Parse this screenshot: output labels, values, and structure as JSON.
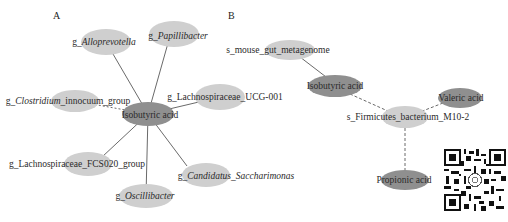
{
  "panels": {
    "A": {
      "label": "A",
      "center": {
        "name": "Isobutyric acid",
        "x": 148,
        "y": 114,
        "rx": 26,
        "ry": 12,
        "color": "#8f8f8f"
      },
      "nodes": [
        {
          "id": "alloprevotella",
          "prefix": "g_",
          "name": "Alloprevotella",
          "italic": true,
          "x": 106,
          "y": 42,
          "rx": 25,
          "ry": 13,
          "color": "#cfcfcf",
          "tx": 103,
          "ty": 45
        },
        {
          "id": "papillibacter",
          "prefix": "g_",
          "name": "Papillibacter",
          "italic": true,
          "x": 174,
          "y": 34,
          "rx": 25,
          "ry": 13,
          "color": "#cfcfcf",
          "tx": 178,
          "ty": 39
        },
        {
          "id": "clostridium",
          "prefix": "g_",
          "name": "Clostridium",
          "italic": true,
          "suffix": "_innocuum_group",
          "x": 75,
          "y": 101,
          "rx": 24,
          "ry": 11,
          "color": "#cfcfcf",
          "tx": 68,
          "ty": 104
        },
        {
          "id": "lachnospiraceae_ucg001",
          "prefix": "g_Lachnospiraceae_UCG-001",
          "name": "",
          "italic": false,
          "x": 220,
          "y": 97,
          "rx": 25,
          "ry": 13,
          "color": "#cfcfcf",
          "tx": 225,
          "ty": 100
        },
        {
          "id": "lachnospiraceae_fcs020",
          "prefix": "g_Lachnospiraceae_FCS020_group",
          "name": "",
          "italic": false,
          "x": 88,
          "y": 164,
          "rx": 24,
          "ry": 12,
          "color": "#cfcfcf",
          "tx": 77,
          "ty": 167
        },
        {
          "id": "saccharimonas",
          "prefix": "g_",
          "name": "Candidatus_Saccharimonas",
          "italic": true,
          "x": 206,
          "y": 175,
          "rx": 24,
          "ry": 12,
          "color": "#cfcfcf",
          "tx": 234,
          "ty": 179
        },
        {
          "id": "oscillibacter",
          "prefix": "g_",
          "name": "Oscillibacter",
          "italic": true,
          "x": 146,
          "y": 196,
          "rx": 27,
          "ry": 12,
          "color": "#cfcfcf",
          "tx": 145,
          "ty": 199
        }
      ]
    },
    "B": {
      "label": "B",
      "nodes": [
        {
          "id": "mouse_gut",
          "text": "s_mouse_gut_metagenome",
          "x": 290,
          "y": 50,
          "rx": 25,
          "ry": 10,
          "color": "#cfcfcf",
          "tx": 278,
          "ty": 53
        },
        {
          "id": "isobutyric_b",
          "text": "Isobutyric acid",
          "x": 335,
          "y": 86,
          "rx": 27,
          "ry": 11,
          "color": "#8f8f8f",
          "tx": 335,
          "ty": 89
        },
        {
          "id": "valeric",
          "text": "Valeric acid",
          "x": 460,
          "y": 98,
          "rx": 22,
          "ry": 10,
          "color": "#8f8f8f",
          "tx": 460,
          "ty": 101
        },
        {
          "id": "firmicutes",
          "text": "s_Firmicutes_bacterium_M10-2",
          "x": 405,
          "y": 117,
          "rx": 23,
          "ry": 11,
          "color": "#cfcfcf",
          "tx": 407,
          "ty": 120
        },
        {
          "id": "propionic",
          "text": "Propionic acid",
          "x": 405,
          "y": 180,
          "rx": 24,
          "ry": 10,
          "color": "#8f8f8f",
          "tx": 400,
          "ty": 183
        }
      ]
    }
  },
  "edges": {
    "A": [
      {
        "from": "center",
        "to": "alloprevotella",
        "style": "solid"
      },
      {
        "from": "center",
        "to": "papillibacter",
        "style": "solid"
      },
      {
        "from": "center",
        "to": "clostridium",
        "style": "solid"
      },
      {
        "from": "center",
        "to": "lachnospiraceae_ucg001",
        "style": "solid"
      },
      {
        "from": "center",
        "to": "lachnospiraceae_fcs020",
        "style": "solid"
      },
      {
        "from": "center",
        "to": "saccharimonas",
        "style": "solid"
      },
      {
        "from": "center",
        "to": "oscillibacter",
        "style": "solid"
      }
    ],
    "B": [
      {
        "from": "mouse_gut",
        "to": "isobutyric_b",
        "style": "solid"
      },
      {
        "from": "isobutyric_b",
        "to": "firmicutes",
        "style": "dashed"
      },
      {
        "from": "valeric",
        "to": "firmicutes",
        "style": "dashed"
      },
      {
        "from": "firmicutes",
        "to": "propionic",
        "style": "dashed"
      }
    ]
  },
  "qr_code": {
    "present": true,
    "label": "qr-code"
  }
}
